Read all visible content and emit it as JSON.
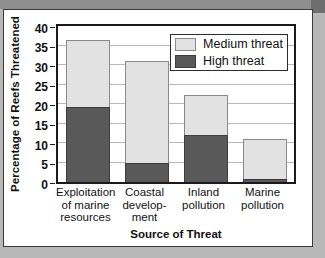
{
  "figure": {
    "caption_title": "Source of Threat"
  },
  "chart_data": {
    "type": "bar",
    "subtype": "stacked-vertical",
    "title": "",
    "xlabel": "Source of Threat",
    "ylabel": "Percentage of Reefs Threatened",
    "ylim": [
      0,
      40
    ],
    "ytick_step": 5,
    "yticks": [
      0,
      5,
      10,
      15,
      20,
      25,
      30,
      35,
      40
    ],
    "ytick_labels": [
      "0",
      "5",
      "10",
      "15",
      "20",
      "25",
      "30",
      "35",
      "40"
    ],
    "grid": true,
    "grid_axis": "y",
    "legend_position": "top-right",
    "categories": [
      "Exploitation of marine resources",
      "Coastal development",
      "Inland pollution",
      "Marine pollution"
    ],
    "category_label_lines": [
      [
        "Exploitation",
        "of marine",
        "resources"
      ],
      [
        "Coastal",
        "develop-",
        "ment"
      ],
      [
        "Inland",
        "pollution"
      ],
      [
        "Marine",
        "pollution"
      ]
    ],
    "series": [
      {
        "name": "High threat",
        "color": "#595959",
        "values": [
          19.3,
          5.0,
          12.0,
          0.7
        ]
      },
      {
        "name": "Medium threat",
        "color": "#e2e2e2",
        "values": [
          17.2,
          26.0,
          10.3,
          10.3
        ]
      }
    ],
    "totals": [
      36.5,
      31.0,
      22.3,
      11.0
    ],
    "stack_order_bottom_to_top": [
      "High threat",
      "Medium threat"
    ]
  },
  "legend": {
    "items": [
      {
        "label": "Medium threat",
        "swatch": "medium"
      },
      {
        "label": "High threat",
        "swatch": "high"
      }
    ]
  }
}
